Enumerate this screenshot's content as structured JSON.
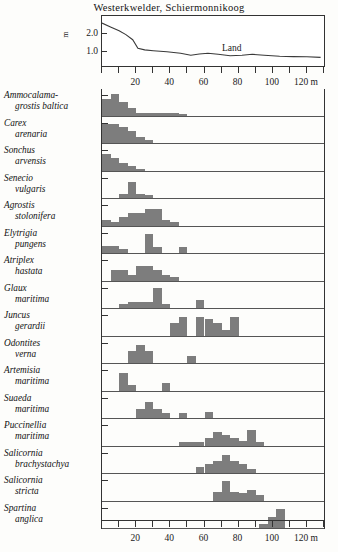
{
  "title": "Westerkwelder, Schiermonnikoog",
  "axis": {
    "y_unit": "m",
    "y_ticks": [
      "2.0",
      "1.0"
    ],
    "x_unit": "m",
    "x_labels": [
      "20",
      "40",
      "60",
      "80",
      "100",
      "120 m"
    ],
    "x_label_values": [
      20,
      40,
      60,
      80,
      100,
      120
    ],
    "x_min": 0,
    "x_max": 130,
    "x_tick_step": 10
  },
  "annotations": {
    "land": "Land",
    "sea": "Sea",
    "sea_arrow": "arrow-right"
  },
  "colors": {
    "bar_fill": "#7d7d7d",
    "axis": "#333333",
    "background": "#fdfdfb"
  },
  "chart_data": {
    "type": "bar",
    "title": "Westerkwelder, Schiermonnikoog",
    "xlabel": "m",
    "ylabel": "m",
    "xlim": [
      0,
      130
    ],
    "grid": false,
    "legend": "none",
    "bin_width": 5,
    "elevation_profile": {
      "name": "Elevation profile",
      "ylim": [
        0.4,
        2.2
      ],
      "x": [
        0,
        5,
        10,
        14,
        18,
        21,
        25,
        30,
        38,
        46,
        52,
        57,
        62,
        68,
        75,
        82,
        88,
        95,
        104,
        112,
        120,
        128
      ],
      "y": [
        2.0,
        1.85,
        1.7,
        1.55,
        1.35,
        1.02,
        0.95,
        0.92,
        0.88,
        0.82,
        0.74,
        0.79,
        0.82,
        0.78,
        0.72,
        0.74,
        0.78,
        0.74,
        0.7,
        0.69,
        0.68,
        0.66
      ]
    },
    "species": [
      {
        "name_line1": "Ammocalama-",
        "name_line2": "grostis baltica",
        "bins": [
          {
            "x": 0,
            "h": 0.62
          },
          {
            "x": 5,
            "h": 0.82
          },
          {
            "x": 10,
            "h": 0.5
          },
          {
            "x": 15,
            "h": 0.3
          },
          {
            "x": 20,
            "h": 0.1
          },
          {
            "x": 25,
            "h": 0.1
          },
          {
            "x": 30,
            "h": 0.1
          },
          {
            "x": 35,
            "h": 0.1
          },
          {
            "x": 40,
            "h": 0.1
          },
          {
            "x": 45,
            "h": 0.07
          }
        ]
      },
      {
        "name_line1": "Carex",
        "name_line2": "arenaria",
        "bins": [
          {
            "x": 0,
            "h": 0.72
          },
          {
            "x": 5,
            "h": 0.72
          },
          {
            "x": 10,
            "h": 0.62
          },
          {
            "x": 15,
            "h": 0.44
          },
          {
            "x": 20,
            "h": 0.22
          },
          {
            "x": 25,
            "h": 0.1
          }
        ]
      },
      {
        "name_line1": "Sonchus",
        "name_line2": "arvensis",
        "bins": [
          {
            "x": 0,
            "h": 0.62
          },
          {
            "x": 5,
            "h": 0.48
          },
          {
            "x": 10,
            "h": 0.3
          },
          {
            "x": 15,
            "h": 0.18
          },
          {
            "x": 20,
            "h": 0.07
          }
        ]
      },
      {
        "name_line1": "Senecio",
        "name_line2": "vulgaris",
        "bins": [
          {
            "x": 10,
            "h": 0.14
          },
          {
            "x": 15,
            "h": 0.62
          },
          {
            "x": 20,
            "h": 0.14
          },
          {
            "x": 25,
            "h": 0.1
          }
        ]
      },
      {
        "name_line1": "Agrostis",
        "name_line2": "stolonifera",
        "bins": [
          {
            "x": 0,
            "h": 0.2
          },
          {
            "x": 5,
            "h": 0.14
          },
          {
            "x": 10,
            "h": 0.34
          },
          {
            "x": 15,
            "h": 0.46
          },
          {
            "x": 20,
            "h": 0.46
          },
          {
            "x": 25,
            "h": 0.62
          },
          {
            "x": 30,
            "h": 0.62
          },
          {
            "x": 35,
            "h": 0.22
          },
          {
            "x": 40,
            "h": 0.14
          }
        ]
      },
      {
        "name_line1": "Elytrigia",
        "name_line2": "pungens",
        "bins": [
          {
            "x": 0,
            "h": 0.26
          },
          {
            "x": 5,
            "h": 0.26
          },
          {
            "x": 10,
            "h": 0.14
          },
          {
            "x": 25,
            "h": 0.72
          },
          {
            "x": 30,
            "h": 0.22
          },
          {
            "x": 45,
            "h": 0.22
          }
        ]
      },
      {
        "name_line1": "Atriplex",
        "name_line2": "hastata",
        "bins": [
          {
            "x": 5,
            "h": 0.38
          },
          {
            "x": 10,
            "h": 0.38
          },
          {
            "x": 15,
            "h": 0.22
          },
          {
            "x": 20,
            "h": 0.56
          },
          {
            "x": 25,
            "h": 0.56
          },
          {
            "x": 30,
            "h": 0.38
          },
          {
            "x": 35,
            "h": 0.2
          },
          {
            "x": 40,
            "h": 0.14
          }
        ]
      },
      {
        "name_line1": "Glaux",
        "name_line2": "maritima",
        "bins": [
          {
            "x": 10,
            "h": 0.16
          },
          {
            "x": 15,
            "h": 0.22
          },
          {
            "x": 20,
            "h": 0.22
          },
          {
            "x": 25,
            "h": 0.22
          },
          {
            "x": 30,
            "h": 0.76
          },
          {
            "x": 35,
            "h": 0.14
          },
          {
            "x": 55,
            "h": 0.3
          }
        ]
      },
      {
        "name_line1": "Juncus",
        "name_line2": "gerardii",
        "bins": [
          {
            "x": 40,
            "h": 0.48
          },
          {
            "x": 45,
            "h": 0.7
          },
          {
            "x": 55,
            "h": 0.7
          },
          {
            "x": 60,
            "h": 0.62
          },
          {
            "x": 65,
            "h": 0.48
          },
          {
            "x": 70,
            "h": 0.2
          },
          {
            "x": 75,
            "h": 0.7
          }
        ]
      },
      {
        "name_line1": "Odontites",
        "name_line2": "verna",
        "bins": [
          {
            "x": 15,
            "h": 0.46
          },
          {
            "x": 20,
            "h": 0.68
          },
          {
            "x": 25,
            "h": 0.46
          },
          {
            "x": 50,
            "h": 0.26
          }
        ]
      },
      {
        "name_line1": "Artemisia",
        "name_line2": "maritima",
        "bins": [
          {
            "x": 10,
            "h": 0.66
          },
          {
            "x": 15,
            "h": 0.2
          },
          {
            "x": 35,
            "h": 0.3
          }
        ]
      },
      {
        "name_line1": "Suaeda",
        "name_line2": "maritima",
        "bins": [
          {
            "x": 20,
            "h": 0.34
          },
          {
            "x": 25,
            "h": 0.62
          },
          {
            "x": 30,
            "h": 0.34
          },
          {
            "x": 35,
            "h": 0.2
          },
          {
            "x": 45,
            "h": 0.2
          },
          {
            "x": 60,
            "h": 0.22
          }
        ]
      },
      {
        "name_line1": "Puccinellia",
        "name_line2": "maritima",
        "bins": [
          {
            "x": 45,
            "h": 0.14
          },
          {
            "x": 50,
            "h": 0.14
          },
          {
            "x": 55,
            "h": 0.14
          },
          {
            "x": 60,
            "h": 0.3
          },
          {
            "x": 65,
            "h": 0.52
          },
          {
            "x": 70,
            "h": 0.4
          },
          {
            "x": 75,
            "h": 0.3
          },
          {
            "x": 80,
            "h": 0.16
          },
          {
            "x": 85,
            "h": 0.58
          },
          {
            "x": 90,
            "h": 0.14
          }
        ]
      },
      {
        "name_line1": "Salicornia",
        "name_line2": "brachystachya",
        "bins": [
          {
            "x": 55,
            "h": 0.22
          },
          {
            "x": 60,
            "h": 0.34
          },
          {
            "x": 65,
            "h": 0.46
          },
          {
            "x": 70,
            "h": 0.7
          },
          {
            "x": 75,
            "h": 0.46
          },
          {
            "x": 80,
            "h": 0.34
          },
          {
            "x": 85,
            "h": 0.16
          }
        ]
      },
      {
        "name_line1": "Salicornia",
        "name_line2": "stricta",
        "bins": [
          {
            "x": 65,
            "h": 0.34
          },
          {
            "x": 70,
            "h": 0.72
          },
          {
            "x": 75,
            "h": 0.34
          },
          {
            "x": 80,
            "h": 0.28
          },
          {
            "x": 85,
            "h": 0.4
          },
          {
            "x": 90,
            "h": 0.22
          }
        ]
      },
      {
        "name_line1": "Spartina",
        "name_line2": "anglica",
        "bins": [
          {
            "x": 92,
            "h": 0.16
          },
          {
            "x": 97,
            "h": 0.42
          },
          {
            "x": 102,
            "h": 0.72
          }
        ]
      }
    ]
  }
}
